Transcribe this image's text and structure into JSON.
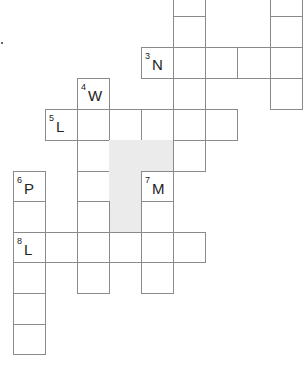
{
  "puzzle": {
    "type": "crossword",
    "cell_width": 32,
    "cell_height": 31,
    "colors": {
      "border": "#8a8a8a",
      "shaded": "#ebebeb",
      "text": "#222222"
    },
    "cells": [
      {
        "x": 173,
        "y": -15,
        "w": 32,
        "h": 31
      },
      {
        "x": 270,
        "y": -15,
        "w": 32,
        "h": 31
      },
      {
        "x": 173,
        "y": 16,
        "w": 32,
        "h": 31
      },
      {
        "x": 270,
        "y": 16,
        "w": 32,
        "h": 31
      },
      {
        "x": 141,
        "y": 47,
        "w": 32,
        "h": 31,
        "num": "3",
        "letter": "N"
      },
      {
        "x": 173,
        "y": 47,
        "w": 32,
        "h": 31
      },
      {
        "x": 205,
        "y": 47,
        "w": 32,
        "h": 31
      },
      {
        "x": 237,
        "y": 47,
        "w": 33,
        "h": 31
      },
      {
        "x": 270,
        "y": 47,
        "w": 32,
        "h": 31
      },
      {
        "x": 77,
        "y": 78,
        "w": 32,
        "h": 31,
        "num": "4",
        "letter": "W"
      },
      {
        "x": 173,
        "y": 78,
        "w": 32,
        "h": 31
      },
      {
        "x": 270,
        "y": 78,
        "w": 32,
        "h": 31
      },
      {
        "x": 45,
        "y": 109,
        "w": 32,
        "h": 31,
        "num": "5",
        "letter": "L"
      },
      {
        "x": 77,
        "y": 109,
        "w": 32,
        "h": 31
      },
      {
        "x": 109,
        "y": 109,
        "w": 32,
        "h": 31
      },
      {
        "x": 141,
        "y": 109,
        "w": 32,
        "h": 31
      },
      {
        "x": 173,
        "y": 109,
        "w": 32,
        "h": 31
      },
      {
        "x": 205,
        "y": 109,
        "w": 32,
        "h": 31
      },
      {
        "x": 77,
        "y": 140,
        "w": 32,
        "h": 31
      },
      {
        "x": 109,
        "y": 140,
        "w": 64,
        "h": 31,
        "shaded": true
      },
      {
        "x": 173,
        "y": 140,
        "w": 32,
        "h": 31
      },
      {
        "x": 13,
        "y": 171,
        "w": 32,
        "h": 30,
        "num": "6",
        "letter": "P"
      },
      {
        "x": 77,
        "y": 171,
        "w": 32,
        "h": 30
      },
      {
        "x": 109,
        "y": 171,
        "w": 32,
        "h": 61,
        "shaded": true
      },
      {
        "x": 141,
        "y": 171,
        "w": 32,
        "h": 30,
        "num": "7",
        "letter": "M"
      },
      {
        "x": 13,
        "y": 201,
        "w": 32,
        "h": 31
      },
      {
        "x": 77,
        "y": 201,
        "w": 32,
        "h": 31
      },
      {
        "x": 141,
        "y": 201,
        "w": 32,
        "h": 31
      },
      {
        "x": 13,
        "y": 232,
        "w": 32,
        "h": 30,
        "num": "8",
        "letter": "L"
      },
      {
        "x": 45,
        "y": 232,
        "w": 32,
        "h": 30
      },
      {
        "x": 77,
        "y": 232,
        "w": 32,
        "h": 30
      },
      {
        "x": 109,
        "y": 232,
        "w": 32,
        "h": 30
      },
      {
        "x": 141,
        "y": 232,
        "w": 32,
        "h": 30
      },
      {
        "x": 173,
        "y": 232,
        "w": 32,
        "h": 30
      },
      {
        "x": 13,
        "y": 262,
        "w": 32,
        "h": 31
      },
      {
        "x": 77,
        "y": 262,
        "w": 32,
        "h": 31
      },
      {
        "x": 141,
        "y": 262,
        "w": 32,
        "h": 31
      },
      {
        "x": 13,
        "y": 293,
        "w": 32,
        "h": 31
      },
      {
        "x": 13,
        "y": 324,
        "w": 32,
        "h": 30
      }
    ],
    "clue_starts": [
      {
        "num": "3",
        "letter": "N"
      },
      {
        "num": "4",
        "letter": "W"
      },
      {
        "num": "5",
        "letter": "L"
      },
      {
        "num": "6",
        "letter": "P"
      },
      {
        "num": "7",
        "letter": "M"
      },
      {
        "num": "8",
        "letter": "L"
      }
    ]
  }
}
